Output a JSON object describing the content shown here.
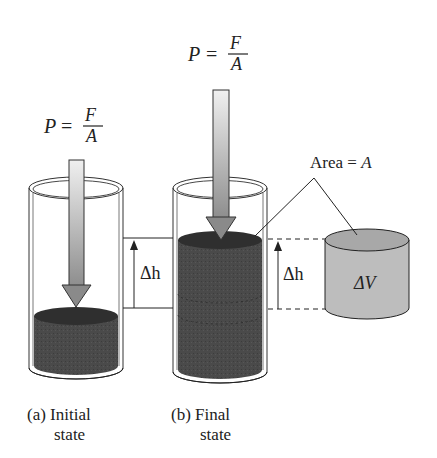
{
  "figure": {
    "panel_a": {
      "pressure_label": {
        "lhs": "P",
        "eq": "=",
        "numerator": "F",
        "denominator": "A"
      },
      "caption_line1": "(a) Initial",
      "caption_line2": "state"
    },
    "panel_b": {
      "pressure_label": {
        "lhs": "P",
        "eq": "=",
        "numerator": "F",
        "denominator": "A"
      },
      "caption_line1": "(b) Final",
      "caption_line2": "state"
    },
    "delta_h_left": "Δh",
    "delta_h_right": "Δh",
    "area_label": {
      "prefix": "Area = ",
      "symbol": "A"
    },
    "volume_label": "ΔV",
    "colors": {
      "fluid": "#4a4a4a",
      "fluid_top": "#2e2e2e",
      "arrow_light": "#e8e8e8",
      "arrow_dark": "#8a8a8a",
      "volume_cylinder": "#b8b8b8",
      "volume_top": "#a6a6a6",
      "outline": "#222222"
    }
  }
}
